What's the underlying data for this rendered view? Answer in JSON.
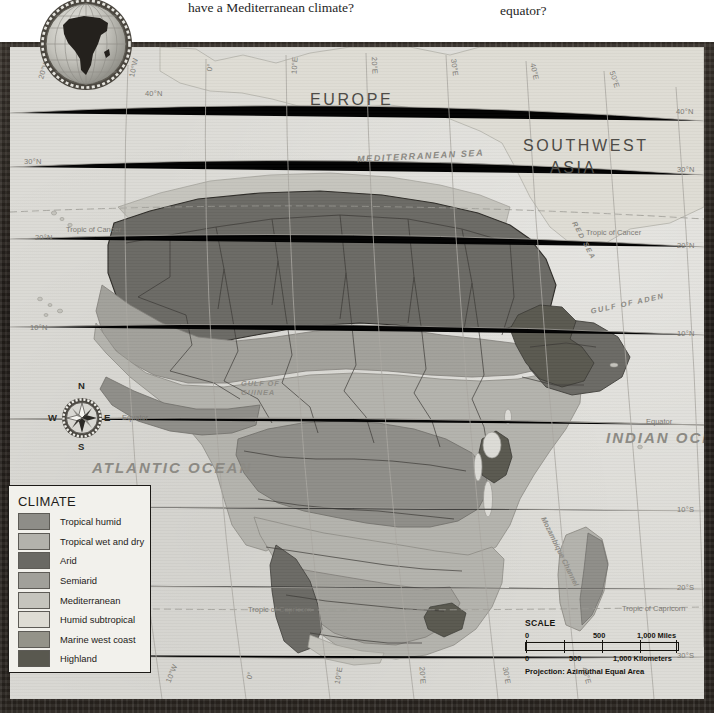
{
  "header": {
    "question_left": "have a Mediterranean climate?",
    "question_right": "equator?"
  },
  "emblem": {
    "name": "africa-globe-emblem"
  },
  "map": {
    "title": "Africa Climate",
    "projection_note": "Projection: Azimuthal Equal Area",
    "labels": {
      "europe": "EUROPE",
      "southwest_asia_line1": "SOUTHWEST",
      "southwest_asia_line2": "ASIA",
      "mediterranean_sea": "MEDITERRANEAN  SEA",
      "red_sea": "RED SEA",
      "gulf_of_aden": "GULF OF ADEN",
      "gulf_of_guinea_l1": "GULF OF",
      "gulf_of_guinea_l2": "GUINEA",
      "atlantic_ocean": "ATLANTIC  OCEAN",
      "indian_ocean": "INDIAN  OCEAN",
      "mozambique_channel": "Mozambique Channel",
      "equator_left": "Equator",
      "equator_right": "Equator",
      "tropic_cancer_left": "Tropic of Cancer",
      "tropic_cancer_right": "Tropic of Cancer",
      "tropic_capricorn_left": "Tropic of Capricorn",
      "tropic_capricorn_right": "Tropic of Capricorn"
    },
    "latitudes_left": [
      "40°N",
      "30°N",
      "20°N",
      "10°N",
      "10°S",
      "20°S",
      "30°S"
    ],
    "latitudes_right": [
      "40°N",
      "30°N",
      "20°N",
      "10°N",
      "10°S",
      "20°S",
      "30°S"
    ],
    "longitudes_top": [
      "20°W",
      "10°W",
      "0°",
      "10°E",
      "20°E",
      "30°E",
      "40°E",
      "50°E"
    ],
    "longitudes_bottom": [
      "10°W",
      "0°",
      "10°E",
      "20°E",
      "30°E",
      "40°E"
    ]
  },
  "legend": {
    "title": "CLIMATE",
    "items": [
      {
        "label": "Tropical humid",
        "color": "#8e8d88"
      },
      {
        "label": "Tropical wet and dry",
        "color": "#b3b2ac"
      },
      {
        "label": "Arid",
        "color": "#6a6964"
      },
      {
        "label": "Semiarid",
        "color": "#a1a09a"
      },
      {
        "label": "Mediterranean",
        "color": "#c5c4bd"
      },
      {
        "label": "Humid subtropical",
        "color": "#dedcd4"
      },
      {
        "label": "Marine west coast",
        "color": "#949389"
      },
      {
        "label": "Highland",
        "color": "#59584f"
      }
    ]
  },
  "compass": {
    "north": "N",
    "east": "E",
    "south": "S",
    "west": "W"
  },
  "scale": {
    "title": "SCALE",
    "miles": {
      "ticks": [
        "0",
        "500",
        "1,000 Miles"
      ]
    },
    "kilometers": {
      "ticks": [
        "0",
        "500",
        "1,000 Kilometers"
      ]
    },
    "projection": "Projection: Azimuthal Equal Area"
  }
}
